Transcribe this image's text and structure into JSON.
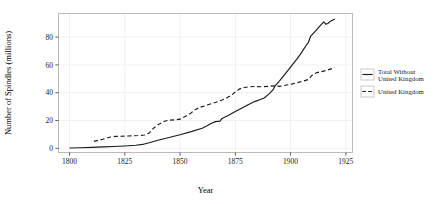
{
  "chart_data": {
    "type": "line",
    "title": "",
    "xlabel": "Year",
    "ylabel": "Number of Spindles (millions)",
    "xlim": [
      1795,
      1928
    ],
    "ylim": [
      -3,
      97
    ],
    "xticks": [
      1800,
      1825,
      1850,
      1875,
      1900,
      1925
    ],
    "xticklabels": [
      "1800",
      "1825",
      "1850",
      "1875",
      "1900",
      "1925"
    ],
    "yticks": [
      0,
      20,
      40,
      60,
      80
    ],
    "yticklabels": [
      "0",
      "20",
      "40",
      "60",
      "80"
    ],
    "grid": true,
    "legend_position": "right",
    "series": [
      {
        "name": "Total Without United Kingdom",
        "style": "solid",
        "color": "#1a1a1a",
        "points": [
          [
            1800,
            0.2
          ],
          [
            1805,
            0.4
          ],
          [
            1810,
            0.7
          ],
          [
            1815,
            1.0
          ],
          [
            1820,
            1.3
          ],
          [
            1825,
            1.7
          ],
          [
            1830,
            2.2
          ],
          [
            1833,
            2.8
          ],
          [
            1836,
            4.0
          ],
          [
            1840,
            5.8
          ],
          [
            1845,
            7.8
          ],
          [
            1850,
            9.8
          ],
          [
            1855,
            12.0
          ],
          [
            1860,
            14.5
          ],
          [
            1862,
            16.0
          ],
          [
            1864,
            17.8
          ],
          [
            1866,
            19.2
          ],
          [
            1867,
            19.4
          ],
          [
            1868,
            19.5
          ],
          [
            1869,
            21.5
          ],
          [
            1872,
            23.8
          ],
          [
            1875,
            26.5
          ],
          [
            1878,
            29.0
          ],
          [
            1881,
            31.5
          ],
          [
            1884,
            33.8
          ],
          [
            1886,
            35.0
          ],
          [
            1888,
            36.2
          ],
          [
            1890,
            38.8
          ],
          [
            1892,
            42.0
          ],
          [
            1893,
            45.0
          ],
          [
            1895,
            48.5
          ],
          [
            1897,
            52.5
          ],
          [
            1899,
            56.5
          ],
          [
            1901,
            60.5
          ],
          [
            1903,
            64.5
          ],
          [
            1905,
            69.0
          ],
          [
            1907,
            74.0
          ],
          [
            1908,
            76.0
          ],
          [
            1909,
            80.5
          ],
          [
            1911,
            84.0
          ],
          [
            1913,
            87.5
          ],
          [
            1915,
            91.0
          ],
          [
            1916,
            89.2
          ],
          [
            1917,
            90.0
          ],
          [
            1918,
            91.5
          ],
          [
            1920,
            93.0
          ]
        ]
      },
      {
        "name": "United Kingdom",
        "style": "dashed",
        "color": "#1a1a1a",
        "points": [
          [
            1811,
            5.0
          ],
          [
            1815,
            6.5
          ],
          [
            1818,
            8.0
          ],
          [
            1821,
            8.6
          ],
          [
            1825,
            8.8
          ],
          [
            1828,
            9.0
          ],
          [
            1831,
            9.2
          ],
          [
            1834,
            9.6
          ],
          [
            1836,
            11.0
          ],
          [
            1838,
            14.5
          ],
          [
            1840,
            17.0
          ],
          [
            1843,
            19.5
          ],
          [
            1845,
            20.3
          ],
          [
            1848,
            20.5
          ],
          [
            1850,
            21.0
          ],
          [
            1853,
            23.5
          ],
          [
            1855,
            25.5
          ],
          [
            1857,
            28.0
          ],
          [
            1859,
            29.5
          ],
          [
            1861,
            30.5
          ],
          [
            1863,
            31.5
          ],
          [
            1865,
            32.5
          ],
          [
            1867,
            33.5
          ],
          [
            1869,
            34.8
          ],
          [
            1871,
            36.2
          ],
          [
            1873,
            38.0
          ],
          [
            1875,
            40.5
          ],
          [
            1877,
            42.8
          ],
          [
            1879,
            43.8
          ],
          [
            1881,
            44.2
          ],
          [
            1884,
            44.5
          ],
          [
            1887,
            44.3
          ],
          [
            1890,
            44.6
          ],
          [
            1893,
            45.0
          ],
          [
            1895,
            44.6
          ],
          [
            1897,
            45.2
          ],
          [
            1900,
            46.0
          ],
          [
            1903,
            47.2
          ],
          [
            1906,
            48.5
          ],
          [
            1908,
            49.5
          ],
          [
            1910,
            53.0
          ],
          [
            1912,
            54.5
          ],
          [
            1914,
            55.2
          ],
          [
            1916,
            56.0
          ],
          [
            1918,
            57.0
          ],
          [
            1920,
            58.0
          ]
        ]
      }
    ]
  },
  "legend": {
    "entries": [
      {
        "label_line1": "Total Without",
        "label_line2": "United Kingdom",
        "style": "solid"
      },
      {
        "label_line1": "United Kingdom",
        "label_line2": "",
        "style": "dashed"
      }
    ]
  },
  "colors": {
    "line": "#1a1a1a",
    "panel_border": "#b3b3b3",
    "gridline": "#f0f0f0",
    "tick_mark": "#4d4d4d",
    "background": "#ffffff"
  }
}
